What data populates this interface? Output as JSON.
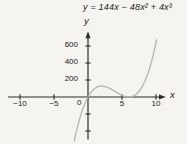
{
  "figure": {
    "equation": "y = 144x − 48x² + 4x³",
    "y_axis_label": "y",
    "x_axis_label": "x",
    "origin_label": "0",
    "colors": {
      "background": "#f5f4f0",
      "axis": "#2a2a2a",
      "curve": "#b4b3af",
      "text": "#1a1a1a"
    }
  },
  "chart_data": {
    "type": "line",
    "title": "y = 144x − 48x² + 4x³",
    "equation": "y = 144x - 48x^2 + 4x^3",
    "polynomial_coefficients_ascending": [
      0,
      144,
      -48,
      4
    ],
    "xlabel": "x",
    "ylabel": "y",
    "x_tick_values": [
      -10,
      -5,
      5,
      10
    ],
    "x_tick_labels": [
      "−10",
      "−5",
      "5",
      "10"
    ],
    "origin_tick_label": "0",
    "y_tick_values_labeled": [
      600,
      400,
      200
    ],
    "y_tick_labels": [
      "600",
      "400",
      "200"
    ],
    "y_tick_values_unlabeled": [
      -200,
      -400
    ],
    "xlim": [
      -11.5,
      12
    ],
    "ylim": [
      -520,
      760
    ],
    "x_drawn_range": [
      -2.0,
      10.17
    ],
    "grid": false,
    "legend": false,
    "key_points": [
      {
        "x": 0,
        "y": 0,
        "note": "root at origin"
      },
      {
        "x": 2,
        "y": 128,
        "note": "local maximum hump"
      },
      {
        "x": 6,
        "y": 0,
        "note": "double root, curve touches x-axis"
      },
      {
        "x": 10,
        "y": 640,
        "note": "steep rise at right edge"
      }
    ]
  }
}
